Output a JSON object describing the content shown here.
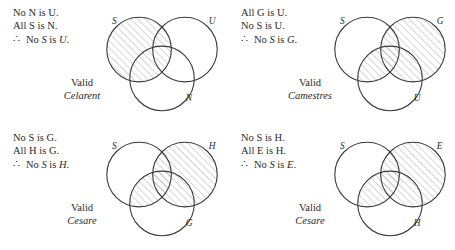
{
  "figure": {
    "style": {
      "circle_stroke": "#3a3a3a",
      "hatch_stroke": "#9a9a9a",
      "text_color": "#2b2b2b",
      "background": "#ffffff"
    }
  },
  "panels": [
    {
      "id": "celarent",
      "premise1": "No N is U.",
      "premise2": "All S is N.",
      "therefore_symbol": "∴",
      "conclusion": "No S is U.",
      "valid_label": "Valid",
      "mood_label": "Celarent",
      "circles": [
        {
          "name": "circle-s",
          "label": "S",
          "cx": 46,
          "cy": 46,
          "r": 38
        },
        {
          "name": "circle-u",
          "label": "U",
          "cx": 100,
          "cy": 46,
          "r": 38
        },
        {
          "name": "circle-n",
          "label": "N",
          "cx": 73,
          "cy": 80,
          "r": 38
        }
      ],
      "labels": [
        {
          "text": "S",
          "x": 14,
          "y": 16
        },
        {
          "text": "U",
          "x": 128,
          "y": 16
        },
        {
          "text": "N",
          "x": 101,
          "y": 107
        }
      ],
      "shaded_regions": [
        "S"
      ],
      "shading_description": "Entire S circle hatched"
    },
    {
      "id": "camestres",
      "premise1": "All G is U.",
      "premise2": "No S is U.",
      "therefore_symbol": "∴",
      "conclusion": "No S is G.",
      "valid_label": "Valid",
      "mood_label": "Camestres",
      "circles": [
        {
          "name": "circle-s",
          "label": "S",
          "cx": 46,
          "cy": 46,
          "r": 38
        },
        {
          "name": "circle-g",
          "label": "G",
          "cx": 100,
          "cy": 46,
          "r": 38
        },
        {
          "name": "circle-u",
          "label": "U",
          "cx": 73,
          "cy": 80,
          "r": 38
        }
      ],
      "labels": [
        {
          "text": "S",
          "x": 14,
          "y": 16
        },
        {
          "text": "G",
          "x": 128,
          "y": 16
        },
        {
          "text": "U",
          "x": 101,
          "y": 107
        }
      ],
      "shaded_regions": [
        "G",
        "S∩U"
      ],
      "shading_description": "Entire G circle hatched plus the S∩U lens"
    },
    {
      "id": "cesare-left",
      "premise1": "No S is G.",
      "premise2": "All H is G.",
      "therefore_symbol": "∴",
      "conclusion": "No S is H.",
      "valid_label": "Valid",
      "mood_label": "Cesare",
      "circles": [
        {
          "name": "circle-s",
          "label": "S",
          "cx": 46,
          "cy": 46,
          "r": 38
        },
        {
          "name": "circle-h",
          "label": "H",
          "cx": 100,
          "cy": 46,
          "r": 38
        },
        {
          "name": "circle-g",
          "label": "G",
          "cx": 73,
          "cy": 80,
          "r": 38
        }
      ],
      "labels": [
        {
          "text": "S",
          "x": 14,
          "y": 16
        },
        {
          "text": "H",
          "x": 128,
          "y": 16
        },
        {
          "text": "G",
          "x": 101,
          "y": 107
        }
      ],
      "shaded_regions": [
        "H",
        "S∩G"
      ],
      "shading_description": "Entire H circle hatched plus the S∩G lens"
    },
    {
      "id": "cesare-right",
      "premise1": "No S is H.",
      "premise2": "All E is H.",
      "therefore_symbol": "∴",
      "conclusion": "No S is E.",
      "valid_label": "Valid",
      "mood_label": "Cesare",
      "circles": [
        {
          "name": "circle-s",
          "label": "S",
          "cx": 46,
          "cy": 46,
          "r": 38
        },
        {
          "name": "circle-e",
          "label": "E",
          "cx": 100,
          "cy": 46,
          "r": 38
        },
        {
          "name": "circle-h",
          "label": "H",
          "cx": 73,
          "cy": 80,
          "r": 38
        }
      ],
      "labels": [
        {
          "text": "S",
          "x": 14,
          "y": 16
        },
        {
          "text": "E",
          "x": 128,
          "y": 16
        },
        {
          "text": "H",
          "x": 101,
          "y": 107
        }
      ],
      "shaded_regions": [
        "E",
        "S∩H"
      ],
      "shading_description": "Entire E circle hatched plus the S∩H lens"
    }
  ]
}
